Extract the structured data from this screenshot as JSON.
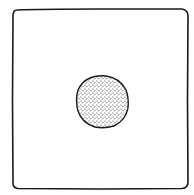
{
  "illustration": {
    "title": "",
    "frame": {
      "shape": "square",
      "stroke": "#1a1a1a",
      "fill": "#ffffff"
    },
    "circle": {
      "shape": "stippled-circle",
      "stroke": "#1a1a1a",
      "dot_color": "#2a2a2a"
    }
  }
}
